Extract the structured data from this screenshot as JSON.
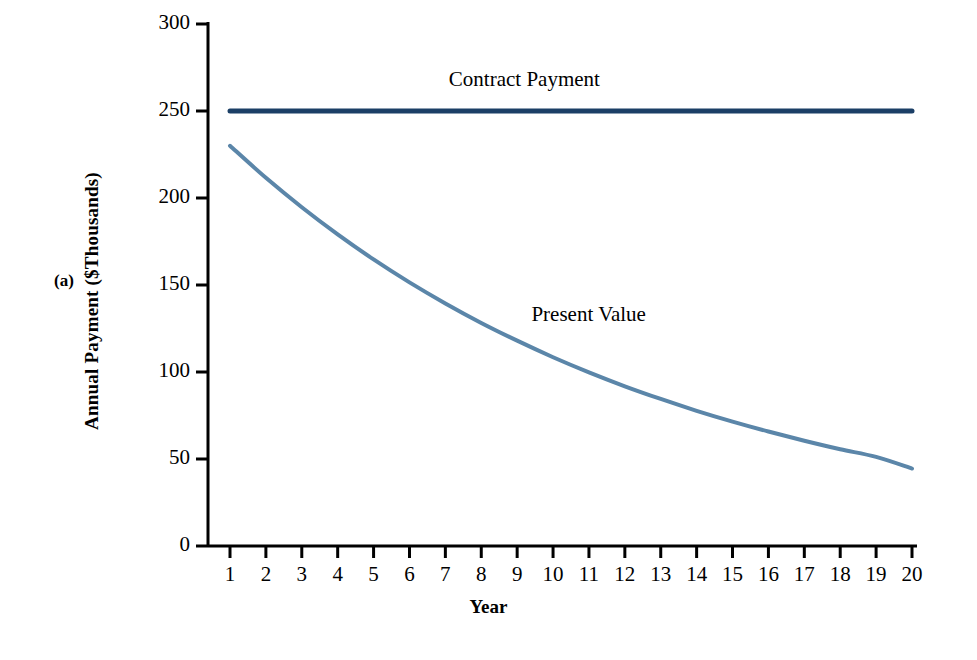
{
  "panel": {
    "tag": "(a)"
  },
  "chart_data": {
    "type": "line",
    "title": "",
    "xlabel": "Year",
    "ylabel": "Annual Payment ($Thousands)",
    "xlim": [
      1,
      20
    ],
    "ylim": [
      0,
      300
    ],
    "grid": false,
    "legend_position": "inline-annotation",
    "x": [
      1,
      2,
      3,
      4,
      5,
      6,
      7,
      8,
      9,
      10,
      11,
      12,
      13,
      14,
      15,
      16,
      17,
      18,
      19,
      20
    ],
    "xtick_labels": [
      "1",
      "2",
      "3",
      "4",
      "5",
      "6",
      "7",
      "8",
      "9",
      "10",
      "11",
      "12",
      "13",
      "14",
      "15",
      "16",
      "17",
      "18",
      "19",
      "20"
    ],
    "ytick_labels": [
      "0",
      "50",
      "100",
      "150",
      "200",
      "250",
      "300"
    ],
    "ytick_values": [
      0,
      50,
      100,
      150,
      200,
      250,
      300
    ],
    "series": [
      {
        "name": "Contract Payment",
        "color": "#1b3f66",
        "width": 5,
        "values": [
          250,
          250,
          250,
          250,
          250,
          250,
          250,
          250,
          250,
          250,
          250,
          250,
          250,
          250,
          250,
          250,
          250,
          250,
          250,
          250
        ]
      },
      {
        "name": "Present Value",
        "color": "#5b86a9",
        "width": 4,
        "values": [
          230,
          211.6,
          194.7,
          179.1,
          164.7,
          151.5,
          139.4,
          128.2,
          118,
          108.5,
          99.8,
          91.8,
          84.5,
          77.7,
          71.5,
          65.8,
          60.5,
          55.6,
          51.2,
          44.5
        ]
      }
    ],
    "annotations": [
      {
        "text": "Contract Payment",
        "x": 9.2,
        "y": 267
      },
      {
        "text": "Present Value",
        "x": 11.0,
        "y": 132
      }
    ]
  }
}
